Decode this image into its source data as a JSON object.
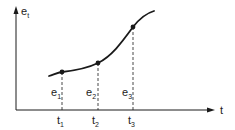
{
  "diagram": {
    "colors": {
      "ink": "#1a1a1a",
      "background": "#ffffff"
    },
    "y_axis": {
      "label": "e",
      "label_sub": "t"
    },
    "x_axis": {
      "label": "t"
    },
    "points": [
      {
        "e_label": "e",
        "e_sub": "1",
        "t_label": "t",
        "t_sub": "1"
      },
      {
        "e_label": "e",
        "e_sub": "2",
        "t_label": "t",
        "t_sub": "2"
      },
      {
        "e_label": "e",
        "e_sub": "3",
        "t_label": "t",
        "t_sub": "3"
      }
    ]
  }
}
